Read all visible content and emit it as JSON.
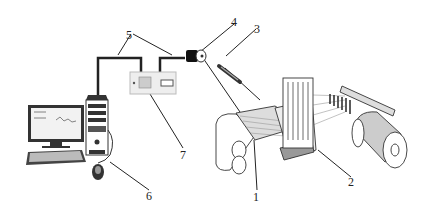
{
  "diagram": {
    "type": "schematic",
    "labels": [
      {
        "id": "1",
        "text": "1",
        "x": 253,
        "y": 191
      },
      {
        "id": "2",
        "text": "2",
        "x": 348,
        "y": 176
      },
      {
        "id": "3",
        "text": "3",
        "x": 254,
        "y": 23
      },
      {
        "id": "4",
        "text": "4",
        "x": 231,
        "y": 16
      },
      {
        "id": "5",
        "text": "5",
        "x": 126,
        "y": 29
      },
      {
        "id": "6",
        "text": "6",
        "x": 146,
        "y": 190
      },
      {
        "id": "7",
        "text": "7",
        "x": 180,
        "y": 149
      }
    ],
    "components": [
      {
        "label": "1",
        "name": "fabric / weaving zone"
      },
      {
        "label": "2",
        "name": "heald frame / reed"
      },
      {
        "label": "3",
        "name": "light source / probe"
      },
      {
        "label": "4",
        "name": "camera sensor"
      },
      {
        "label": "5",
        "name": "signal cables"
      },
      {
        "label": "6",
        "name": "computer"
      },
      {
        "label": "7",
        "name": "controller / acquisition box"
      }
    ]
  }
}
